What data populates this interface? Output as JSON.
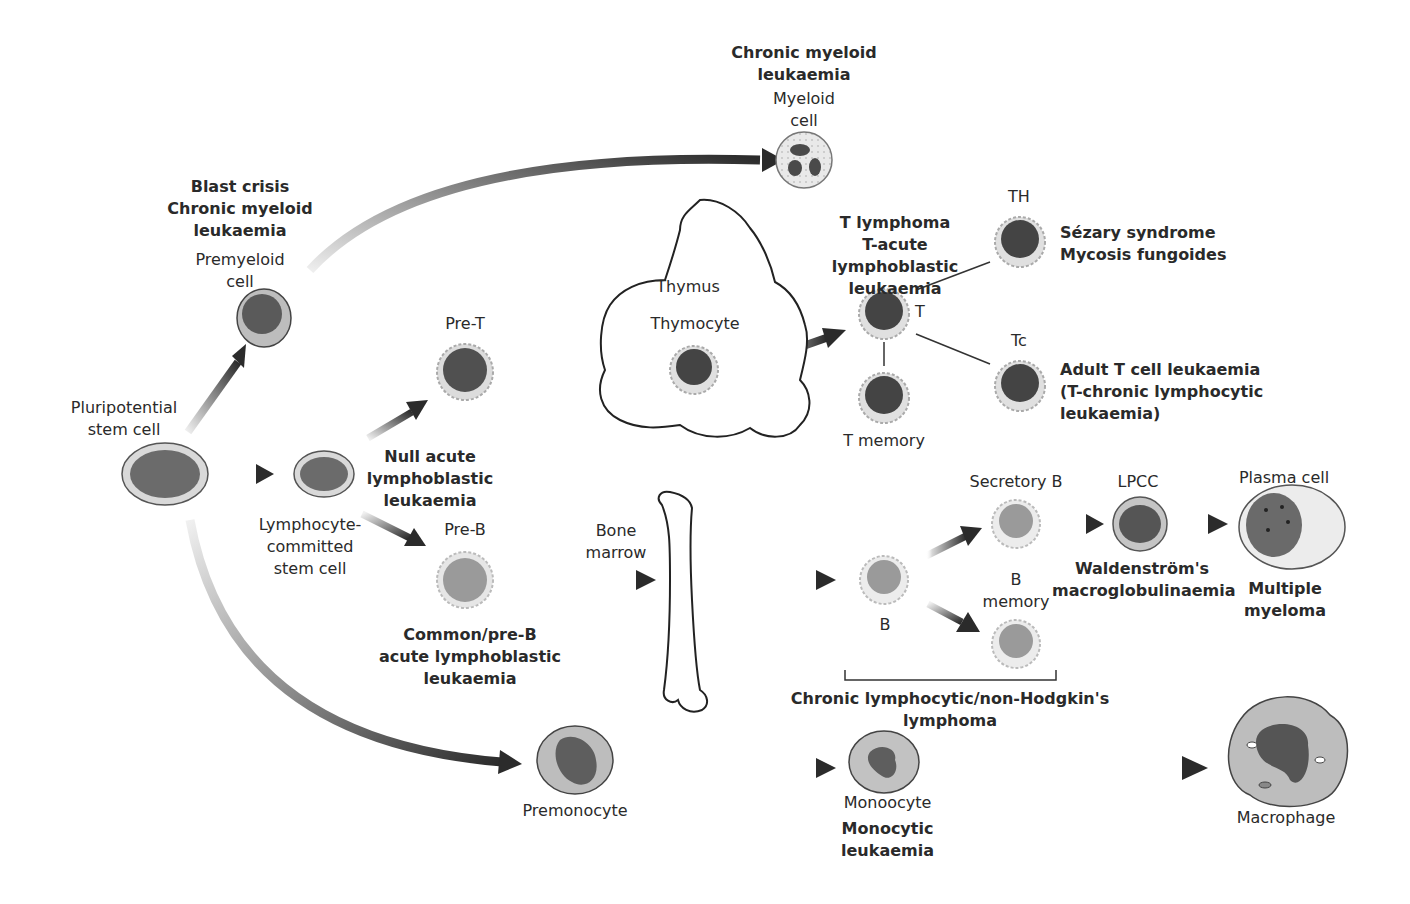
{
  "diagram": {
    "colors": {
      "nucleus_dark": "#555555",
      "nucleus_mid": "#8a8a8a",
      "cytoplasm": "#c9c9c9",
      "cytoplasm_light": "#e6e6e6",
      "arrow": "#2b2b2b",
      "outline": "#333333"
    },
    "nodes": {
      "pluripotential": {
        "label": "Pluripotential\nstem cell"
      },
      "lymphocyte_committed": {
        "label": "Lymphocyte-\ncommitted\nstem cell"
      },
      "premyeloid": {
        "label": "Premyeloid\ncell",
        "disease": "Blast crisis\nChronic myeloid\nleukaemia"
      },
      "myeloid": {
        "label": "Myeloid\ncell",
        "disease": "Chronic myeloid\nleukaemia"
      },
      "pre_t": {
        "label": "Pre-T"
      },
      "null_all": {
        "disease": "Null acute\nlymphoblastic\nleukaemia"
      },
      "pre_b": {
        "label": "Pre-B",
        "disease": "Common/pre-B\nacute lymphoblastic\nleukaemia"
      },
      "thymus": {
        "label": "Thymus",
        "cell_label": "Thymocyte"
      },
      "t_cell": {
        "label": "T",
        "disease": "T lymphoma\nT-acute lymphoblastic\nleukaemia"
      },
      "th": {
        "label": "TH",
        "disease": "Sézary syndrome\nMycosis fungoides"
      },
      "tc": {
        "label": "Tc",
        "disease": "Adult T cell leukaemia\n(T-chronic lymphocytic\nleukaemia)"
      },
      "t_memory": {
        "label": "T memory"
      },
      "bone_marrow": {
        "label": "Bone\nmarrow"
      },
      "b_cell": {
        "label": "B"
      },
      "secretory_b": {
        "label": "Secretory B"
      },
      "b_memory": {
        "label": "B\nmemory"
      },
      "lpcc": {
        "label": "LPCC",
        "disease": "Waldenström's\nmacroglobulinaemia"
      },
      "plasma": {
        "label": "Plasma cell",
        "disease": "Multiple\nmyeloma"
      },
      "b_group": {
        "disease": "Chronic lymphocytic/non-Hodgkin's\nlymphoma"
      },
      "premonocyte": {
        "label": "Premonocyte"
      },
      "monocyte": {
        "label": "Monoocyte",
        "disease": "Monocytic\nleukaemia"
      },
      "macrophage": {
        "label": "Macrophage"
      }
    }
  }
}
